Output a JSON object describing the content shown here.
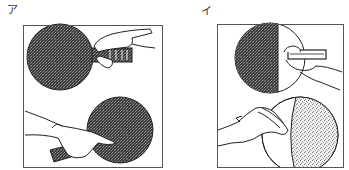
{
  "figure": {
    "panels": [
      {
        "label": "ア",
        "description": "Shakehand grip: forehand side (top) and backhand side (bottom), both rubber faces dark",
        "top_paddle": {
          "face": "dark-rubber",
          "grip": "shakehand-forehand"
        },
        "bottom_paddle": {
          "face": "dark-rubber",
          "grip": "shakehand-backhand"
        }
      },
      {
        "label": "イ",
        "description": "Penhold grip: front face dark rubber (top), back face light rubber (bottom)",
        "top_paddle": {
          "face": "dark-rubber",
          "grip": "penhold-front"
        },
        "bottom_paddle": {
          "face": "light-rubber",
          "grip": "penhold-back"
        }
      }
    ],
    "colors": {
      "ink": "#222222",
      "dark_rubber": "#4a4a4a",
      "light_rubber": "#d6d6d6",
      "frame": "#555555",
      "background": "#ffffff"
    }
  }
}
